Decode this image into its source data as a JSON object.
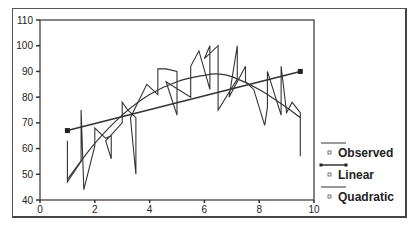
{
  "chart_data": {
    "type": "line",
    "title": "",
    "xlabel": "",
    "ylabel": "",
    "xlim": [
      0,
      10
    ],
    "ylim": [
      40,
      110
    ],
    "x_ticks": [
      0,
      2,
      4,
      6,
      8,
      10
    ],
    "y_ticks": [
      40,
      50,
      60,
      70,
      80,
      90,
      100,
      110
    ],
    "grid": false,
    "legend_position": "right",
    "series": [
      {
        "name": "Observed",
        "style": "jagged line with vertical spikes",
        "x": [
          1.0,
          1.0,
          1.5,
          1.5,
          1.6,
          2.0,
          2.0,
          2.4,
          2.6,
          2.6,
          2.4,
          3.0,
          3.0,
          3.2,
          3.5,
          3.5,
          3.3,
          3.9,
          4.3,
          4.3,
          4.6,
          5.0,
          5.0,
          4.6,
          5.5,
          5.5,
          5.8,
          6.2,
          6.2,
          6.0,
          6.5,
          6.5,
          7.2,
          7.2,
          6.9,
          7.5,
          7.5,
          7.8,
          8.2,
          8.3,
          8.3,
          8.8,
          8.8,
          9.0,
          9.2,
          9.5,
          9.5
        ],
        "y": [
          63,
          47,
          55,
          75,
          44,
          61,
          68,
          64,
          65,
          56,
          63,
          70,
          78,
          75,
          72,
          50,
          72,
          85,
          81,
          91,
          91,
          90,
          73,
          86,
          80,
          92,
          98,
          83,
          100,
          95,
          100,
          75,
          87,
          100,
          80,
          92,
          86,
          83,
          69,
          76,
          90,
          73,
          92,
          74,
          78,
          74,
          57
        ]
      },
      {
        "name": "Linear",
        "style": "straight fit line with square markers at ends",
        "x": [
          1.0,
          9.5
        ],
        "y": [
          67,
          90
        ]
      },
      {
        "name": "Quadratic",
        "style": "smooth curve",
        "x": [
          1.0,
          2.0,
          3.0,
          4.0,
          5.0,
          6.0,
          6.5,
          7.0,
          8.0,
          9.0,
          9.5
        ],
        "y": [
          48,
          62,
          73,
          81,
          86,
          88.5,
          89,
          88,
          83,
          76,
          72
        ]
      }
    ]
  },
  "legend": {
    "items": [
      {
        "label": "Observed"
      },
      {
        "label": "Linear"
      },
      {
        "label": "Quadratic"
      }
    ]
  }
}
